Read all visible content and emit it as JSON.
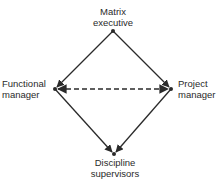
{
  "diagram": {
    "type": "relationship-diamond",
    "colors": {
      "line": "#2a2a2a",
      "text": "#2a2a2a",
      "background": "#ffffff"
    },
    "nodes": {
      "top": {
        "line1": "Matrix",
        "line2": "executive"
      },
      "left": {
        "line1": "Functional",
        "line2": "manager"
      },
      "right": {
        "line1": "Project",
        "line2": "manager"
      },
      "bottom": {
        "line1": "Discipline",
        "line2": "supervisors"
      }
    },
    "edges": [
      {
        "from": "top",
        "to": "left",
        "style": "solid",
        "arrow": "end"
      },
      {
        "from": "top",
        "to": "right",
        "style": "solid",
        "arrow": "end"
      },
      {
        "from": "left",
        "to": "bottom",
        "style": "solid",
        "arrow": "end"
      },
      {
        "from": "right",
        "to": "bottom",
        "style": "solid",
        "arrow": "end"
      },
      {
        "from": "left",
        "to": "right",
        "style": "dashed",
        "arrow": "both"
      }
    ]
  }
}
